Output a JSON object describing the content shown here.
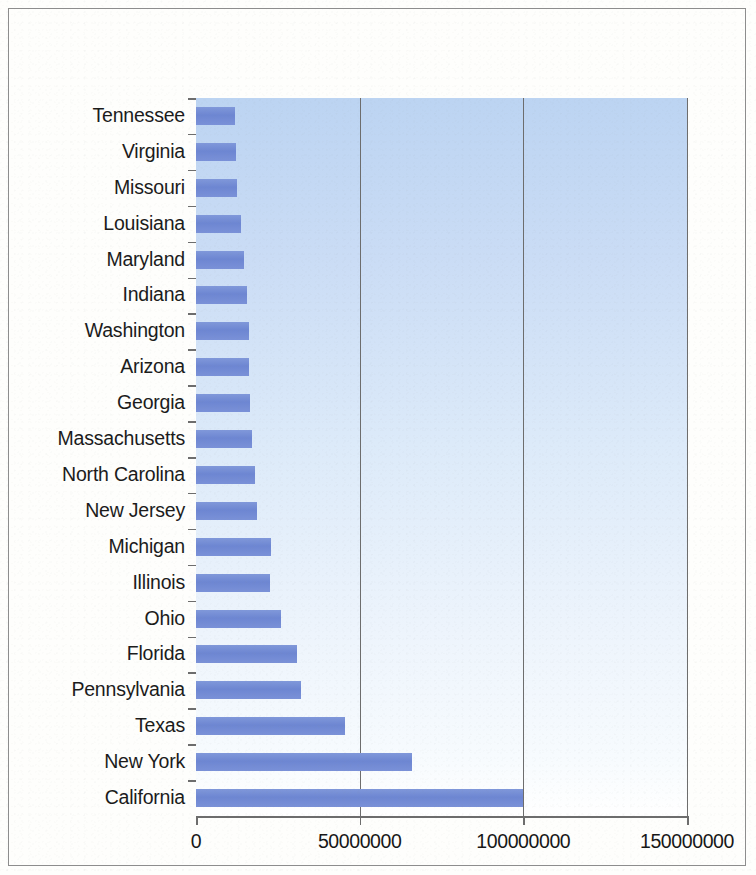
{
  "figure": {
    "kind": "scanned-figure",
    "frame_color": "#8d8d8d",
    "ghost_text": "or the contrary a\nsubstantial part of\nbe greater than in\nthe year 1990 and\nthe holding of state\nreturn to the normal\nsearch of the lower\nis reported as in the\nlower levels of such\nconditions to make\nthe general state of\nthe second of these"
  },
  "chart_data": {
    "type": "bar",
    "orientation": "horizontal",
    "title": "",
    "subtitle": "",
    "xlabel": "",
    "ylabel": "",
    "categories": [
      "Tennessee",
      "Virginia",
      "Missouri",
      "Louisiana",
      "Maryland",
      "Indiana",
      "Washington",
      "Arizona",
      "Georgia",
      "Massachusetts",
      "North Carolina",
      "New Jersey",
      "Michigan",
      "Illinois",
      "Ohio",
      "Florida",
      "Pennsylvania",
      "Texas",
      "New York",
      "California"
    ],
    "values": [
      12000000,
      12200000,
      12500000,
      13800000,
      14800000,
      15500000,
      16200000,
      16300000,
      16500000,
      17000000,
      18000000,
      18500000,
      23000000,
      22500000,
      26000000,
      31000000,
      32000000,
      45500000,
      66000000,
      100000000
    ],
    "xlim": [
      0,
      150000000
    ],
    "ylim_count": 20,
    "xticks": [
      0,
      50000000,
      100000000,
      150000000
    ],
    "xticklabels": [
      "0",
      "50000000",
      "100000000",
      "150000000"
    ],
    "grid": {
      "vertical": true,
      "horizontal": false,
      "color": "#6d6d6d"
    },
    "legend": {
      "visible": false,
      "position": "none",
      "entries": []
    },
    "bar_color": "#7189d4",
    "plot_background": "light-blue-vertical-gradient",
    "plot_background_top": "#bcd4f2",
    "plot_background_bottom": "#ffffff",
    "axis_color": "#6d6d6d",
    "tick_label_color": "#171717"
  }
}
